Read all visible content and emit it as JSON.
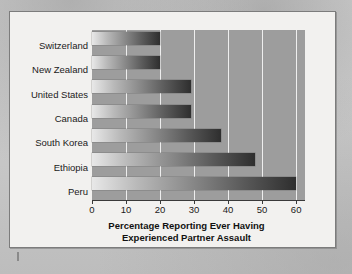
{
  "figure": {
    "background_color": "#f2f1ef",
    "frame_color": "#7c7c7c",
    "plot_background_color": "#9d9d9d",
    "gridline_color": "#eeeeee",
    "bar_gradient_start": "#e8e8e8",
    "bar_gradient_end": "#2e2e2e"
  },
  "chart_data": {
    "type": "bar",
    "orientation": "horizontal",
    "title": "",
    "xlabel_line1": "Percentage Reporting Ever Having",
    "xlabel_line2": "Experienced Partner Assault",
    "ylabel": "",
    "categories": [
      "Switzerland",
      "New Zealand",
      "United States",
      "Canada",
      "South Korea",
      "Ethiopia",
      "Peru"
    ],
    "values": [
      20,
      20,
      29,
      29,
      38,
      48,
      60
    ],
    "xlim": [
      0,
      62.6
    ],
    "xticks": [
      0,
      10,
      20,
      30,
      40,
      50,
      60
    ],
    "xticklabels": [
      "0",
      "10",
      "20",
      "30",
      "40",
      "50",
      "60"
    ],
    "grid": "vertical-only",
    "legend": "none"
  }
}
